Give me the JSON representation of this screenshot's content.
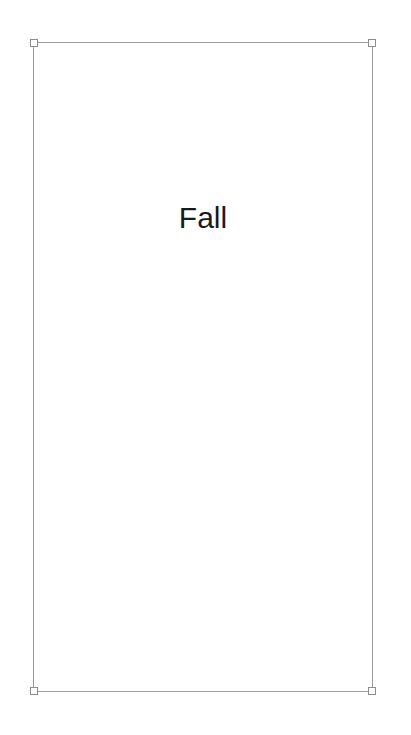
{
  "canvas": {
    "background_color": "#ffffff",
    "width": 411,
    "height": 735
  },
  "text_frame": {
    "name": "text-placeholder",
    "selected": true,
    "border_color": "#9a9a9a",
    "fill": "none",
    "bounds": {
      "x": 33,
      "y": 42,
      "width": 340,
      "height": 650
    },
    "text": {
      "content": "Fall",
      "color": "#1a1a1a",
      "font_size_px": 30,
      "align": "center"
    },
    "handles": [
      {
        "id": "nw",
        "label": "top-left-resize-handle"
      },
      {
        "id": "ne",
        "label": "top-right-resize-handle"
      },
      {
        "id": "sw",
        "label": "bottom-left-resize-handle"
      },
      {
        "id": "se",
        "label": "bottom-right-resize-handle"
      }
    ]
  }
}
